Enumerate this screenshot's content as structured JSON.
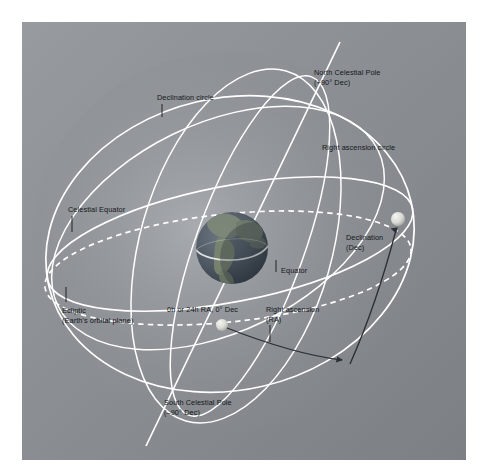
{
  "figure": {
    "background_color": "#ffffff",
    "panel_color": "#8a8d91"
  },
  "labels": {
    "north_celestial_pole": {
      "line1": "North Celestial Pole",
      "line2": "(+90° Dec)"
    },
    "south_celestial_pole": {
      "line1": "South Celestial Pole",
      "line2": "(–90° Dec)"
    },
    "declination_circle": "Declination circle",
    "right_ascension_circle": "Right ascension circle",
    "celestial_equator": "Celestial Equator",
    "equator": "Equator",
    "declination": {
      "line1": "Declination",
      "line2": "(Dec)"
    },
    "right_ascension": {
      "line1": "Right ascension",
      "line2": "(RA)"
    },
    "ecliptic": {
      "line1": "Ecliptic",
      "line2": "(Earth's orbital plane)"
    },
    "zero_point": "0h or 24h RA, 0° Dec"
  },
  "colors": {
    "panel_gray_light": "#93969a",
    "panel_gray_dark": "#7e8184",
    "sphere_line": "#ffffff",
    "label_text": "#14161a",
    "measure_arc": "#2b2f36",
    "earth_ocean": "#4a5560",
    "earth_land": "#7f8a7c",
    "star_marker": "#e8e9e4"
  },
  "elements": {
    "earth": {
      "name": "Earth",
      "center_x": 210,
      "center_y": 226,
      "radius": 36
    },
    "star_declination": {
      "name": "Star on celestial sphere",
      "center_x": 376,
      "center_y": 197,
      "radius": 7
    },
    "vernal_point": {
      "name": "Vernal equinox reference point",
      "center_x": 200,
      "center_y": 303,
      "radius": 6
    }
  }
}
